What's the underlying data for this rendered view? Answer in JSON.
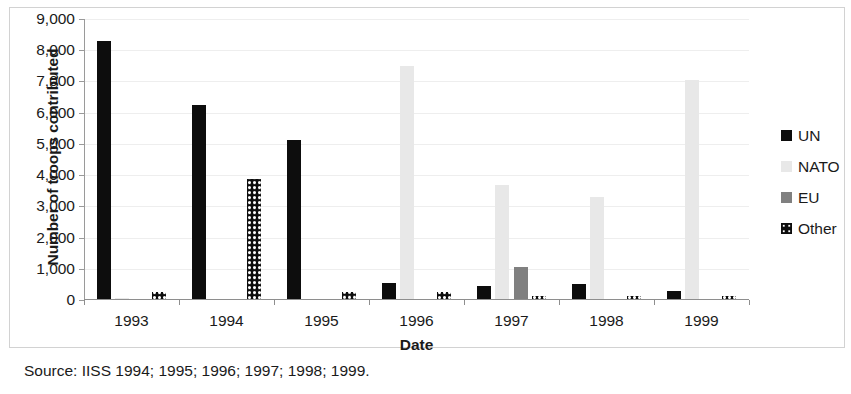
{
  "chart_data": {
    "type": "bar",
    "title": "",
    "xlabel": "Date",
    "ylabel": "Number of troops contributed",
    "categories": [
      "1993",
      "1994",
      "1995",
      "1996",
      "1997",
      "1998",
      "1999"
    ],
    "ylim": [
      0,
      9000
    ],
    "yticks": [
      0,
      1000,
      2000,
      3000,
      4000,
      5000,
      6000,
      7000,
      8000,
      9000
    ],
    "ytick_labels": [
      "0",
      "1,000",
      "2,000",
      "3,000",
      "4,000",
      "5,000",
      "6,000",
      "7,000",
      "8,000",
      "9,000"
    ],
    "grid": true,
    "legend_position": "right",
    "series": [
      {
        "name": "UN",
        "color": "#0d0d0d",
        "pattern": "solid",
        "values": [
          8300,
          6250,
          5120,
          550,
          450,
          520,
          280
        ]
      },
      {
        "name": "NATO",
        "color": "#e8e8e8",
        "pattern": "solid",
        "values": [
          50,
          0,
          0,
          7480,
          3680,
          3300,
          7060
        ]
      },
      {
        "name": "EU",
        "color": "#808080",
        "pattern": "solid",
        "values": [
          0,
          0,
          0,
          0,
          1050,
          0,
          0
        ]
      },
      {
        "name": "Other",
        "color": "#0d0d0d",
        "pattern": "checkered",
        "values": [
          260,
          3880,
          250,
          260,
          130,
          130,
          130
        ]
      }
    ]
  },
  "legend": {
    "items": [
      {
        "label": "UN"
      },
      {
        "label": "NATO"
      },
      {
        "label": "EU"
      },
      {
        "label": "Other"
      }
    ]
  },
  "caption": {
    "source": "Source: IISS 1994; 1995; 1996; 1997; 1998; 1999."
  }
}
